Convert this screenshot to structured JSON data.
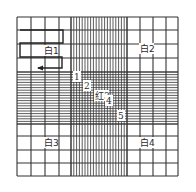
{
  "diagram": {
    "type": "hemocytometer-counting-grid",
    "colors": {
      "line": "#333333",
      "background": "#ffffff",
      "label_bg": "#ffffff"
    },
    "grid": {
      "outer": {
        "x0": 17,
        "y0": 17,
        "x1": 178,
        "y1": 176
      },
      "coarse_x": [
        17,
        31,
        45,
        59,
        71,
        127,
        140,
        153,
        166,
        178
      ],
      "coarse_y": [
        17,
        30,
        44,
        58,
        72,
        124,
        136,
        150,
        163,
        176
      ],
      "dense_band_x": [
        71,
        127
      ],
      "dense_band_y": [
        72,
        124
      ],
      "dense_divisions": 20
    },
    "corner_labels": [
      {
        "text": "白1",
        "x": 44,
        "y": 54
      },
      {
        "text": "白2",
        "x": 140,
        "y": 52
      },
      {
        "text": "白3",
        "x": 44,
        "y": 146
      },
      {
        "text": "白4",
        "x": 140,
        "y": 146
      }
    ],
    "center_labels": [
      {
        "text": "1",
        "x": 74,
        "y": 80
      },
      {
        "text": "2",
        "x": 84,
        "y": 89
      },
      {
        "text": "红3",
        "x": 95,
        "y": 99
      },
      {
        "text": "4",
        "x": 106,
        "y": 104
      },
      {
        "text": "5",
        "x": 118,
        "y": 119
      }
    ],
    "path": {
      "points": [
        [
          20,
          30
        ],
        [
          63,
          30
        ],
        [
          63,
          43
        ],
        [
          20,
          43
        ],
        [
          20,
          57
        ],
        [
          62,
          57
        ],
        [
          62,
          68
        ],
        [
          38,
          68
        ]
      ],
      "arrow_end": [
        38,
        68
      ]
    }
  }
}
